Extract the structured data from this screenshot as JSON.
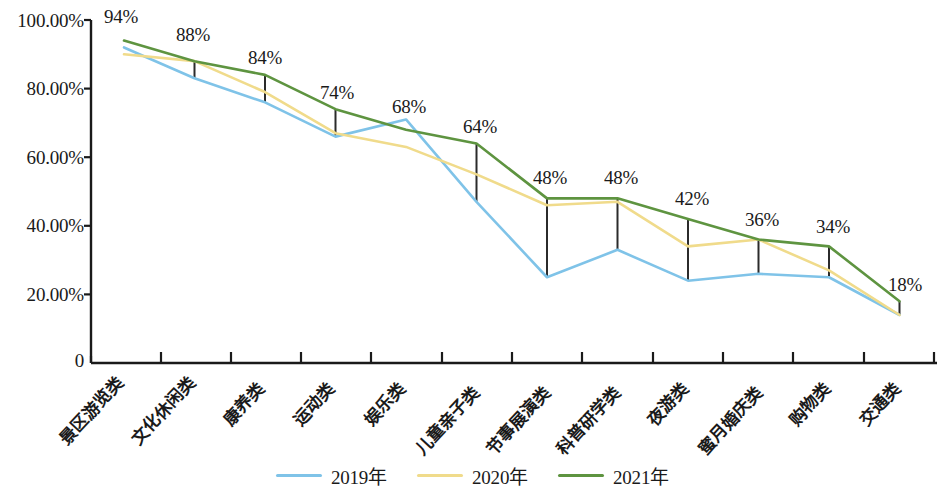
{
  "chart_data": {
    "type": "line",
    "title": "",
    "subtitle": "",
    "xlabel": "",
    "ylabel": "",
    "ylim": [
      0,
      100
    ],
    "grid": false,
    "legend_position": "bottom-center",
    "y_ticks": [
      "0",
      "20.00%",
      "40.00%",
      "60.00%",
      "80.00%",
      "100.00%"
    ],
    "y_tick_values": [
      0,
      20,
      40,
      60,
      80,
      100
    ],
    "categories": [
      "景区游览类",
      "文化休闲类",
      "康养类",
      "运动类",
      "娱乐类",
      "儿童亲子类",
      "节事展演类",
      "科普研学类",
      "夜游类",
      "蜜月婚庆类",
      "购物类",
      "交通类"
    ],
    "series": [
      {
        "name": "2019年",
        "color": "#7FC3E8",
        "values": [
          92,
          83,
          76,
          66,
          71,
          47,
          25,
          33,
          24,
          26,
          25,
          14
        ]
      },
      {
        "name": "2020年",
        "color": "#F0DB8B",
        "values": [
          90,
          88,
          79,
          67,
          63,
          55,
          46,
          47,
          34,
          36,
          27,
          14
        ]
      },
      {
        "name": "2021年",
        "color": "#5E9440",
        "values": [
          94,
          88,
          84,
          74,
          68,
          64,
          48,
          48,
          42,
          36,
          34,
          18
        ]
      }
    ],
    "data_labels": [
      "94%",
      "88%",
      "84%",
      "74%",
      "68%",
      "64%",
      "48%",
      "48%",
      "42%",
      "36%",
      "34%",
      "18%"
    ],
    "range_bars": {
      "description": "vertical black connectors from 2019 value to 2021 value",
      "color": "#2b2b2b",
      "at_categories": [
        1,
        2,
        3,
        5,
        6,
        7,
        8,
        9,
        10,
        11
      ]
    }
  },
  "legend": {
    "items": [
      {
        "label": "2019年",
        "color": "#7FC3E8"
      },
      {
        "label": "2020年",
        "color": "#F0DB8B"
      },
      {
        "label": "2021年",
        "color": "#5E9440"
      }
    ]
  },
  "axis": {
    "color": "#1a1a1a"
  }
}
